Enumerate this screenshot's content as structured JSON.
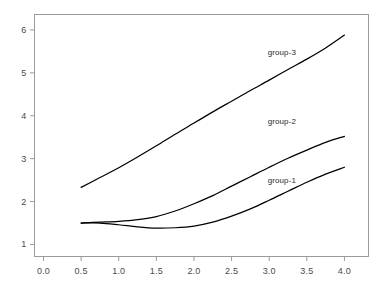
{
  "chart_data": {
    "type": "line",
    "title": "",
    "subtitle": "",
    "xlabel": "",
    "ylabel": "",
    "xlim": [
      -0.12,
      4.32
    ],
    "ylim": [
      0.72,
      6.36
    ],
    "xticks": [
      "0.0",
      "0.5",
      "1.0",
      "1.5",
      "2.0",
      "2.5",
      "3.0",
      "3.5",
      "4.0"
    ],
    "xtick_values": [
      0.0,
      0.5,
      1.0,
      1.5,
      2.0,
      2.5,
      3.0,
      3.5,
      4.0
    ],
    "yticks": [
      "1",
      "2",
      "3",
      "4",
      "5",
      "6"
    ],
    "ytick_values": [
      1,
      2,
      3,
      4,
      5,
      6
    ],
    "grid": false,
    "legend_position": "inline-right",
    "frame_color": "#9a9a9a",
    "line_color": "#000000",
    "x": [
      0.5,
      0.75,
      1.0,
      1.25,
      1.5,
      1.75,
      2.0,
      2.25,
      2.5,
      2.75,
      3.0,
      3.25,
      3.5,
      3.75,
      4.0
    ],
    "series": [
      {
        "name": "group-1",
        "label": "group-1",
        "values": [
          1.5,
          1.5,
          1.46,
          1.41,
          1.38,
          1.39,
          1.43,
          1.52,
          1.66,
          1.83,
          2.03,
          2.24,
          2.45,
          2.64,
          2.8
        ],
        "label_x": 2.98,
        "label_y": 2.48
      },
      {
        "name": "group-2",
        "label": "group-2",
        "values": [
          1.5,
          1.52,
          1.54,
          1.58,
          1.65,
          1.78,
          1.95,
          2.14,
          2.36,
          2.58,
          2.8,
          3.01,
          3.2,
          3.38,
          3.52
        ],
        "label_x": 2.98,
        "label_y": 3.86
      },
      {
        "name": "group-3",
        "label": "group-3",
        "values": [
          2.33,
          2.56,
          2.79,
          3.04,
          3.3,
          3.57,
          3.83,
          4.09,
          4.34,
          4.59,
          4.83,
          5.08,
          5.32,
          5.58,
          5.88
        ],
        "label_x": 2.98,
        "label_y": 5.46
      }
    ]
  }
}
